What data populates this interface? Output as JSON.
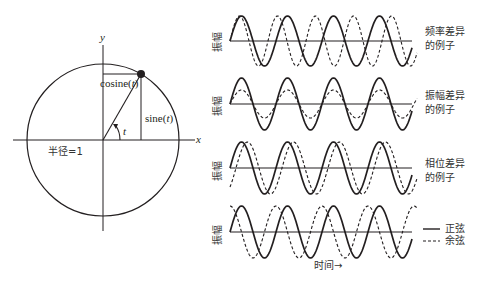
{
  "unit_circle": {
    "y_axis_label": "y",
    "x_axis_label": "x",
    "cosine_label": "cosine(",
    "sine_label": "sine(",
    "t": "t",
    "close_paren": ")",
    "angle_label": "t",
    "radius_label": "半径=1",
    "center": [
      103,
      140
    ],
    "radius": 76,
    "angle_deg": 60
  },
  "waves": {
    "y_axis_label": "振幅",
    "x_axis_label": "时间→",
    "x_start": 230,
    "x_end": 412,
    "panels": [
      {
        "note_line1": "频率差异",
        "note_line2": "的例子",
        "baseline": 41,
        "solid": {
          "amplitude": 25,
          "period": 46,
          "phase": 0
        },
        "dashed": {
          "amplitude": 25,
          "period": 38,
          "phase": 0
        }
      },
      {
        "note_line1": "振幅差异",
        "note_line2": "的例子",
        "baseline": 104,
        "solid": {
          "amplitude": 26,
          "period": 46,
          "phase": 0
        },
        "dashed": {
          "amplitude": 14,
          "period": 46,
          "phase": 0
        }
      },
      {
        "note_line1": "相位差异",
        "note_line2": "的例子",
        "baseline": 168,
        "solid": {
          "amplitude": 26,
          "period": 46,
          "phase": 0
        },
        "dashed": {
          "amplitude": 26,
          "period": 46,
          "phase": -6
        }
      },
      {
        "baseline": 232,
        "solid": {
          "amplitude": 26,
          "period": 46,
          "phase": 0
        },
        "dashed": {
          "amplitude": 26,
          "period": 46,
          "phase": 11.5
        }
      }
    ],
    "legend": [
      {
        "style": "solid",
        "label": "正弦"
      },
      {
        "style": "dashed",
        "label": "余弦"
      }
    ]
  }
}
